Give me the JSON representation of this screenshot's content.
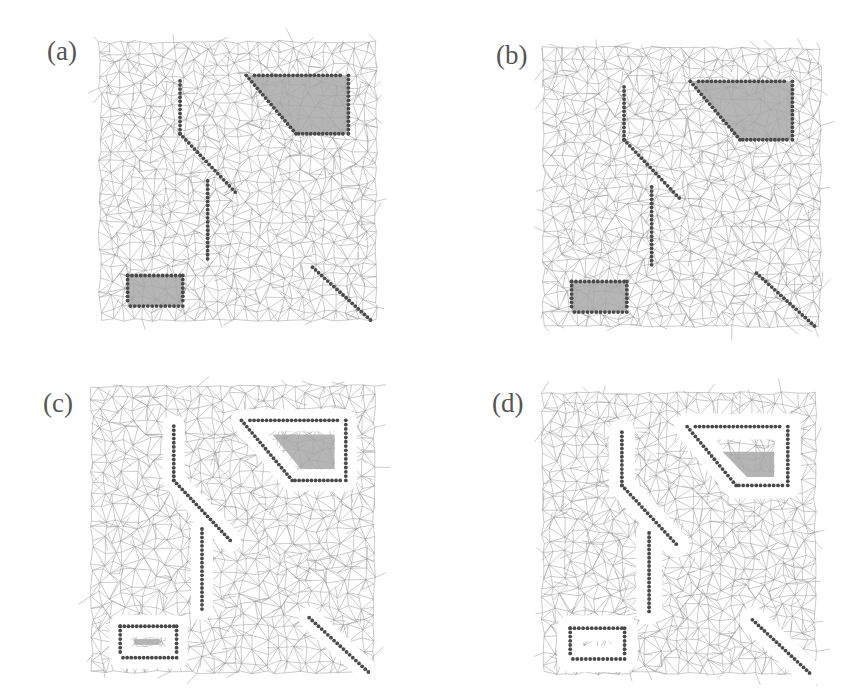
{
  "figure": {
    "panels": [
      {
        "id": "a",
        "label": "(a)",
        "label_pos": [
          47,
          58
        ],
        "origin": [
          100,
          42
        ],
        "size": [
          276,
          278
        ],
        "halo": false,
        "inner_fill": "full"
      },
      {
        "id": "b",
        "label": "(b)",
        "label_pos": [
          496,
          62
        ],
        "origin": [
          544,
          48
        ],
        "size": [
          276,
          278
        ],
        "halo": false,
        "inner_fill": "full"
      },
      {
        "id": "c",
        "label": "(c)",
        "label_pos": [
          43,
          410
        ],
        "origin": [
          92,
          386
        ],
        "size": [
          282,
          286
        ],
        "halo": true,
        "inner_fill": "shrunk"
      },
      {
        "id": "d",
        "label": "(d)",
        "label_pos": [
          492,
          410
        ],
        "origin": [
          543,
          393
        ],
        "size": [
          272,
          280
        ],
        "halo": true,
        "inner_fill": "shrunk-more"
      }
    ],
    "colors": {
      "mesh_edge": "#9a9a9a",
      "obstacle_dot": "#4a4a4a",
      "obstacle_fill": "#a8a8a8",
      "label": "#555555",
      "halo": "#ffffff"
    }
  }
}
